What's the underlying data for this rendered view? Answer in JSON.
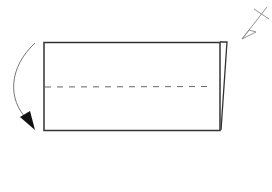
{
  "diagram": {
    "type": "origami-fold-step",
    "colors": {
      "stroke": "#333333",
      "dashed": "#555555",
      "arrow": "#777777",
      "arrowhead": "#111111",
      "background": "#ffffff"
    },
    "paper": {
      "x": 44,
      "y": 42,
      "width": 176,
      "height": 88
    },
    "fold_line": {
      "style": "dashed",
      "y": 87,
      "x1": 44,
      "x2": 213
    },
    "fold_arrow": {
      "direction": "down",
      "side": "left"
    },
    "symbol": {
      "name": "turn-over-symbol"
    }
  }
}
